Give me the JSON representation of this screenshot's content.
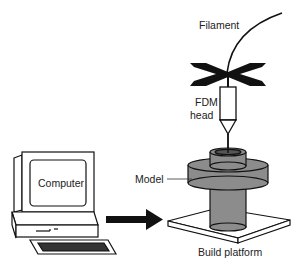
{
  "diagram": {
    "labels": {
      "filament": "Filament",
      "fdm_head_line1": "FDM",
      "fdm_head_line2": "head",
      "model": "Model",
      "computer": "Computer",
      "build_platform": "Build platform"
    },
    "colors": {
      "model_fill": "#8c8c8c",
      "ink": "#111111",
      "background": "#ffffff"
    }
  }
}
